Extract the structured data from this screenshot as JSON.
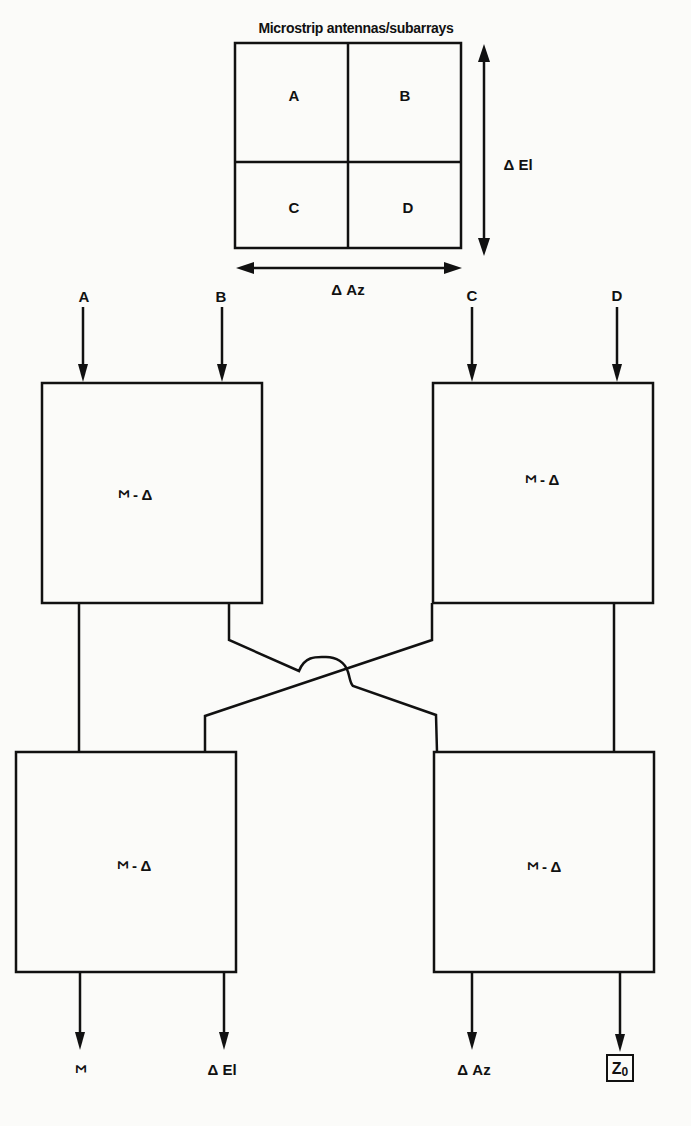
{
  "title": "Microstrip antennas/subarrays",
  "array": {
    "quadrants": [
      "A",
      "B",
      "C",
      "D"
    ],
    "elevation_axis_label": "Δ El",
    "azimuth_axis_label": "Δ Az"
  },
  "inputs": [
    "A",
    "B",
    "C",
    "D"
  ],
  "hybrids": {
    "label_sigma": "Σ",
    "label_rest": "- Δ",
    "count": 4,
    "names": [
      "top-left",
      "top-right",
      "bottom-left",
      "bottom-right"
    ]
  },
  "outputs": {
    "sum": "Σ",
    "delta_el": "Δ El",
    "delta_az": "Δ Az",
    "termination": "Z",
    "termination_sub": "0"
  }
}
